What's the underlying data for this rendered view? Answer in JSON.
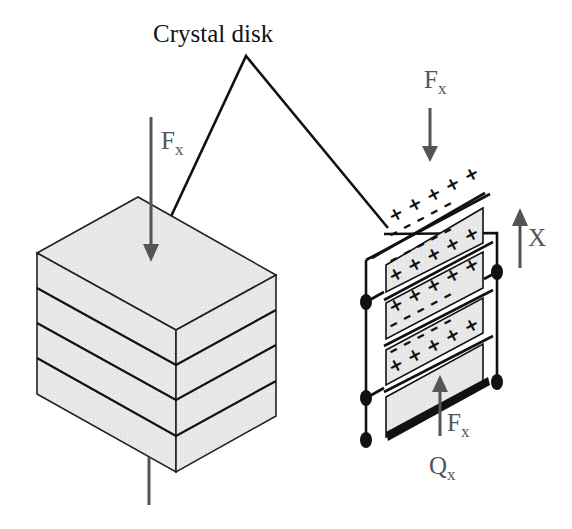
{
  "diagram": {
    "title_label": "Crystal disk",
    "left_stack": {
      "force_label": "F",
      "force_subscript": "x",
      "layers": 4
    },
    "right_stack": {
      "top_force_label": "F",
      "top_force_subscript": "x",
      "bottom_force_label": "F",
      "bottom_force_subscript": "x",
      "axis_label": "X",
      "charge_label": "Q",
      "charge_subscript": "x",
      "plates": [
        {
          "top_row": "+ + + + +",
          "bottom_row": "– – – – –"
        },
        {
          "top_row": "– – – – –",
          "bottom_row": "+ + + + +"
        },
        {
          "top_row": "+ + + + +",
          "bottom_row": "– – – – –"
        },
        {
          "top_row": "– – – – –",
          "bottom_row": "+ + + + +"
        }
      ]
    },
    "colors": {
      "line": "#111111",
      "arrow": "#555555",
      "fill": "#e6e6e6",
      "background": "#ffffff"
    }
  }
}
